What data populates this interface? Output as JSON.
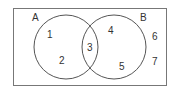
{
  "diagram": {
    "type": "venn",
    "universe_frame": {
      "x": 13,
      "y": 8,
      "width": 153,
      "height": 77
    },
    "sets": [
      {
        "name": "A",
        "label": "A",
        "cx": 66,
        "cy": 47,
        "r": 32,
        "label_pos": [
          32,
          21
        ]
      },
      {
        "name": "B",
        "label": "B",
        "cx": 114,
        "cy": 47,
        "r": 32,
        "label_pos": [
          140,
          21
        ]
      }
    ],
    "regions": [
      {
        "label": "1",
        "pos": [
          47,
          38
        ],
        "membership": "A only"
      },
      {
        "label": "2",
        "pos": [
          59,
          64
        ],
        "membership": "A only"
      },
      {
        "label": "3",
        "pos": [
          87,
          51
        ],
        "membership": "A and B"
      },
      {
        "label": "4",
        "pos": [
          108,
          34
        ],
        "membership": "B only"
      },
      {
        "label": "5",
        "pos": [
          119,
          70
        ],
        "membership": "B only"
      },
      {
        "label": "6",
        "pos": [
          152,
          40
        ],
        "membership": "neither"
      },
      {
        "label": "7",
        "pos": [
          152,
          65
        ],
        "membership": "neither"
      }
    ],
    "colors": {
      "stroke": "#555555",
      "frame": "#777777",
      "text": "#333333"
    }
  }
}
